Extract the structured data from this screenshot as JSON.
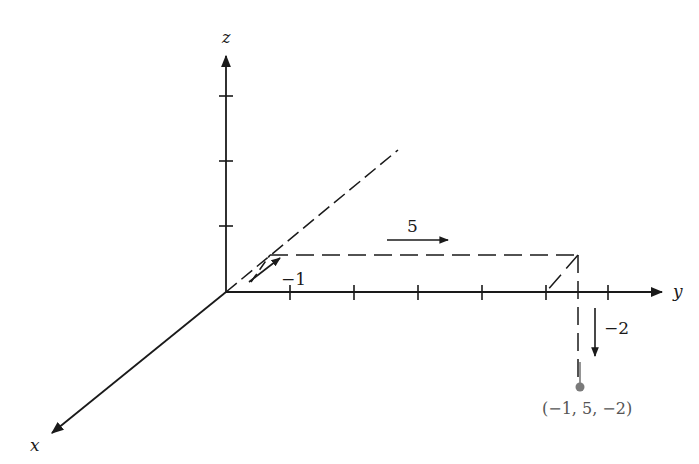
{
  "diagram": {
    "type": "3d-coordinate-axes",
    "axes": {
      "x": {
        "label": "x"
      },
      "y": {
        "label": "y"
      },
      "z": {
        "label": "z"
      }
    },
    "steps": [
      {
        "label": "−1",
        "direction": "negative x"
      },
      {
        "label": "5",
        "direction": "positive y"
      },
      {
        "label": "−2",
        "direction": "negative z"
      }
    ],
    "point": {
      "label": "(−1, 5, −2)",
      "coords": [
        -1,
        5,
        -2
      ],
      "color": "#7a7a7a"
    },
    "colors": {
      "ink": "#1a1a1a",
      "point": "#7a7a7a"
    }
  }
}
